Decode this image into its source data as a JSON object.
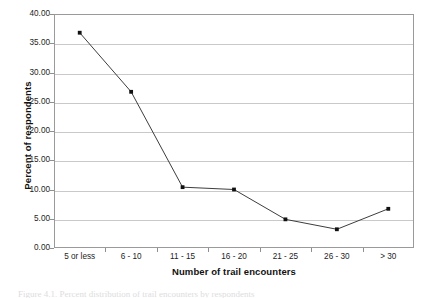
{
  "chart_data": {
    "type": "line",
    "title": "",
    "subtitle": "",
    "xlabel": "Number of trail encounters",
    "ylabel": "Percent of respondents",
    "categories": [
      "5 or less",
      "6 - 10",
      "11 - 15",
      "16 - 20",
      "21 - 25",
      "26 - 30",
      "> 30"
    ],
    "values": [
      36.8,
      26.7,
      10.4,
      10.0,
      4.9,
      3.2,
      6.7
    ],
    "series": [
      {
        "name": "Percent of respondents",
        "values": [
          36.8,
          26.7,
          10.4,
          10.0,
          4.9,
          3.2,
          6.7
        ]
      }
    ],
    "ylim": [
      0.0,
      40.0
    ],
    "ytick_labels": [
      "0.00",
      "5.00",
      "10.00",
      "15.00",
      "20.00",
      "25.00",
      "30.00",
      "35.00",
      "40.00"
    ],
    "ytick_values": [
      0,
      5,
      10,
      15,
      20,
      25,
      30,
      35,
      40
    ],
    "grid": {
      "horizontal": true,
      "vertical": false
    },
    "legend": {
      "visible": false,
      "position": "none"
    },
    "marker": "square",
    "line_color": "#3d3d3d",
    "marker_color": "#111111",
    "grid_color": "#c9c9c9",
    "axis_color": "#9a9a9a",
    "background": "#ffffff"
  },
  "caption": {
    "text": "Figure 4.1. Percent distribution of trail encounters by respondents"
  }
}
